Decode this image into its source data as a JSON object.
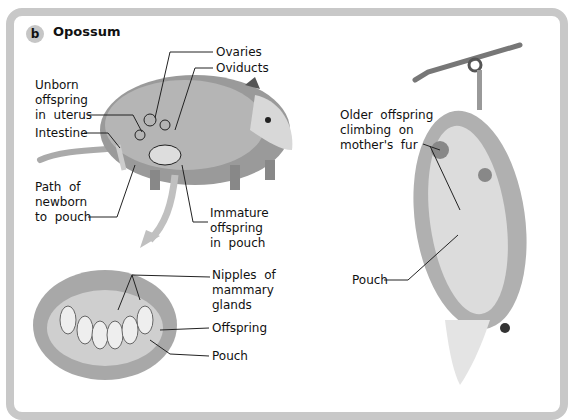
{
  "figure": {
    "badge": "b",
    "title": "Opossum"
  },
  "labels": {
    "ovaries": "Ovaries",
    "oviducts": "Oviducts",
    "unborn": "Unborn\noffspring\nin  uterus",
    "intestine": "Intestine",
    "path": "Path  of\nnewborn\nto  pouch",
    "immature": "Immature\noffspring\nin  pouch",
    "nipples": "Nipples  of\nmammary\nglands",
    "offspring": "Offspring",
    "pouch_inset": "Pouch",
    "older": "Older  offspring\nclimbing  on\nmother's  fur",
    "pouch_hanging": "Pouch"
  },
  "colors": {
    "frame": "#c8c8c8",
    "badge": "#c6c6c6",
    "arrow": "#c0c0c0",
    "fur": "#8a8a8a"
  }
}
